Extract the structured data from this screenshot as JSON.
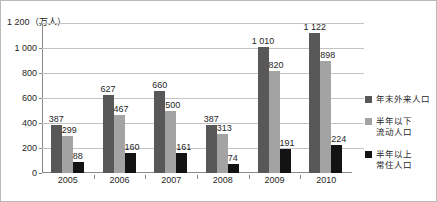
{
  "chart_data": {
    "type": "bar",
    "title": "",
    "subtitle": "",
    "xlabel": "",
    "ylabel": "万人",
    "unit_caption": "1 200（万人）",
    "categories": [
      "2005",
      "2006",
      "2007",
      "2008",
      "2009",
      "2010"
    ],
    "series": [
      {
        "name": "年末外来人口",
        "color": "#585858",
        "values": [
          387,
          627,
          660,
          387,
          1010,
          1122
        ],
        "labels": [
          "387",
          "627",
          "660",
          "387",
          "1 010",
          "1 122"
        ]
      },
      {
        "name": "半年以下\n流动人口",
        "color": "#a3a3a3",
        "values": [
          299,
          467,
          500,
          313,
          820,
          898
        ],
        "labels": [
          "299",
          "467",
          "500",
          "313",
          "820",
          "898"
        ]
      },
      {
        "name": "半年以上\n常住人口",
        "color": "#131313",
        "values": [
          88,
          160,
          161,
          74,
          191,
          224
        ],
        "labels": [
          "88",
          "160",
          "161",
          "74",
          "191",
          "224"
        ]
      }
    ],
    "ylim": [
      0,
      1200
    ],
    "yticks": [
      0,
      200,
      400,
      600,
      800,
      1000,
      1200
    ],
    "ytick_labels": [
      "0",
      "200",
      "400",
      "600",
      "800",
      "1 000",
      "1 200"
    ],
    "grid": true,
    "legend_position": "right"
  },
  "legend": {
    "items": [
      {
        "label": "年末外来人口"
      },
      {
        "label": "半年以下\n流动人口"
      },
      {
        "label": "半年以上\n常住人口"
      }
    ]
  }
}
